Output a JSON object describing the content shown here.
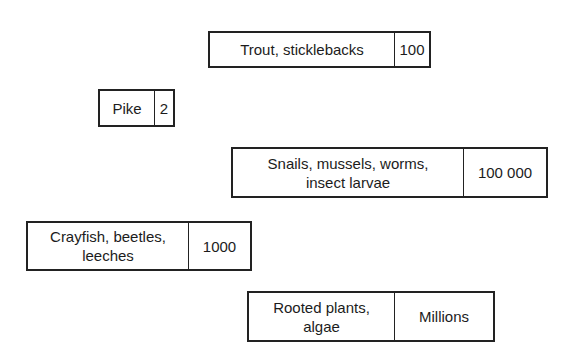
{
  "boxes": [
    {
      "name": "Trout, sticklebacks",
      "count": "100"
    },
    {
      "name": "Pike",
      "count": "2"
    },
    {
      "name": "Snails, mussels, worms,\ninsect larvae",
      "count": "100 000"
    },
    {
      "name": "Crayfish, beetles,\nleeches",
      "count": "1000"
    },
    {
      "name": "Rooted plants,\nalgae",
      "count": "Millions"
    }
  ]
}
